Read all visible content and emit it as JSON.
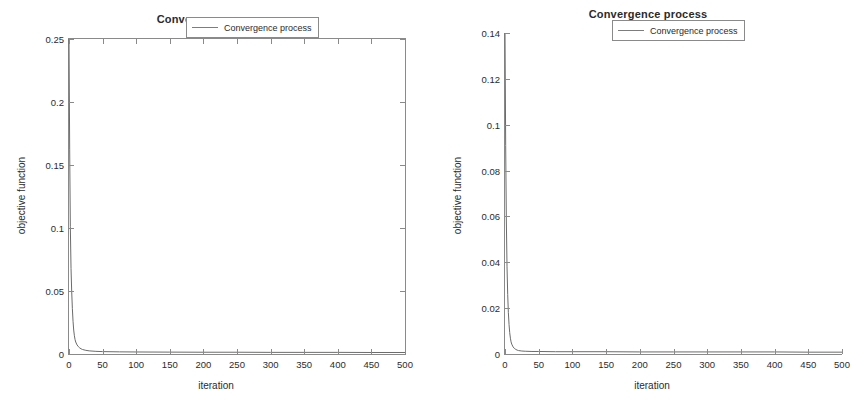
{
  "charts": [
    {
      "id": "left",
      "title": "Convergence process",
      "xlabel": "iteration",
      "ylabel": "objective function",
      "legend_label": "Convergence process",
      "yticks": [
        "0",
        "0.05",
        "0.1",
        "0.15",
        "0.2",
        "0.25"
      ],
      "xticks": [
        "0",
        "50",
        "100",
        "150",
        "200",
        "250",
        "300",
        "350",
        "400",
        "450",
        "500"
      ]
    },
    {
      "id": "right",
      "title": "Convergence process",
      "xlabel": "iteration",
      "ylabel": "objective function",
      "legend_label": "Convergence process",
      "yticks": [
        "0",
        "0.02",
        "0.04",
        "0.06",
        "0.08",
        "0.1",
        "0.12",
        "0.14"
      ],
      "xticks": [
        "0",
        "50",
        "100",
        "150",
        "200",
        "250",
        "300",
        "350",
        "400",
        "450",
        "500"
      ]
    }
  ],
  "chart_data": [
    {
      "type": "line",
      "title": "Convergence process",
      "xlabel": "iteration",
      "ylabel": "objective function",
      "legend": [
        "Convergence process"
      ],
      "legend_position": "top-right",
      "grid": false,
      "box_frame": true,
      "xlim": [
        0,
        500
      ],
      "ylim": [
        0,
        0.25
      ],
      "xticks": [
        0,
        50,
        100,
        150,
        200,
        250,
        300,
        350,
        400,
        450,
        500
      ],
      "yticks": [
        0,
        0.05,
        0.1,
        0.15,
        0.2,
        0.25
      ],
      "line_color": "#6b6b6b",
      "series": [
        {
          "name": "Convergence process",
          "x": [
            0,
            1,
            2,
            3,
            4,
            5,
            6,
            7,
            8,
            9,
            10,
            12,
            14,
            16,
            18,
            20,
            25,
            30,
            40,
            50,
            75,
            100,
            150,
            200,
            250,
            300,
            350,
            400,
            450,
            500
          ],
          "y": [
            0.25,
            0.162,
            0.101,
            0.068,
            0.05,
            0.036,
            0.026,
            0.019,
            0.0145,
            0.0115,
            0.0095,
            0.0072,
            0.0058,
            0.0048,
            0.0041,
            0.0036,
            0.0029,
            0.0025,
            0.0021,
            0.0019,
            0.0017,
            0.0016,
            0.0015,
            0.0014,
            0.0014,
            0.0013,
            0.0013,
            0.0013,
            0.0012,
            0.0012
          ]
        }
      ]
    },
    {
      "type": "line",
      "title": "Convergence process",
      "xlabel": "iteration",
      "ylabel": "objective function",
      "legend": [
        "Convergence process"
      ],
      "legend_position": "top-right",
      "grid": false,
      "box_frame": false,
      "xlim": [
        0,
        500
      ],
      "ylim": [
        0,
        0.14
      ],
      "xticks": [
        0,
        50,
        100,
        150,
        200,
        250,
        300,
        350,
        400,
        450,
        500
      ],
      "yticks": [
        0,
        0.02,
        0.04,
        0.06,
        0.08,
        0.1,
        0.12,
        0.14
      ],
      "line_color": "#6b6b6b",
      "series": [
        {
          "name": "Convergence process",
          "x": [
            0,
            1,
            2,
            3,
            4,
            5,
            6,
            7,
            8,
            9,
            10,
            12,
            14,
            16,
            18,
            20,
            25,
            30,
            40,
            50,
            75,
            100,
            150,
            200,
            250,
            300,
            350,
            400,
            450,
            500
          ],
          "y": [
            0.14,
            0.091,
            0.058,
            0.038,
            0.026,
            0.018,
            0.0128,
            0.0093,
            0.0069,
            0.0053,
            0.0043,
            0.0031,
            0.0024,
            0.002,
            0.0017,
            0.0015,
            0.0013,
            0.0012,
            0.0011,
            0.0011,
            0.001,
            0.001,
            0.001,
            0.0009,
            0.0009,
            0.0009,
            0.0009,
            0.0009,
            0.0008,
            0.0008
          ]
        }
      ]
    }
  ]
}
